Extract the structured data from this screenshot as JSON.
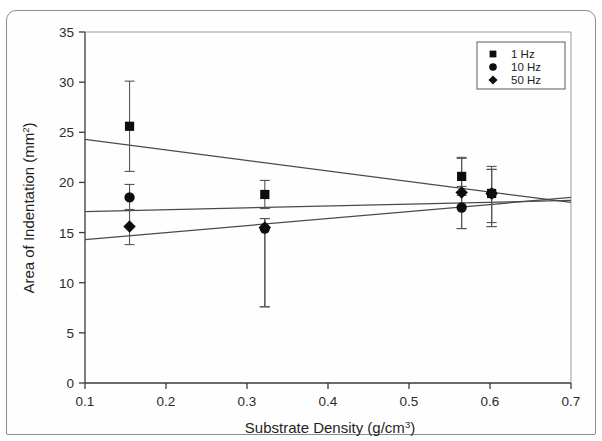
{
  "chart_data": {
    "type": "scatter",
    "title": "",
    "xlabel": "Substrate Density (g/cm3)",
    "xlabel_base": "Substrate Density (g/cm",
    "xlabel_sup": "3",
    "xlabel_tail": ")",
    "ylabel": "Area of Indentation (mm2)",
    "ylabel_base": "Area of Indentation (mm",
    "ylabel_sup": "2",
    "ylabel_tail": ")",
    "xlim": [
      0.1,
      0.7
    ],
    "ylim": [
      0,
      35
    ],
    "xticks": [
      "0.1",
      "0.2",
      "0.3",
      "0.4",
      "0.5",
      "0.6",
      "0.7"
    ],
    "xtick_values": [
      0.1,
      0.2,
      0.3,
      0.4,
      0.5,
      0.6,
      0.7
    ],
    "yticks": [
      "0",
      "5",
      "10",
      "15",
      "20",
      "25",
      "30",
      "35"
    ],
    "ytick_values": [
      0,
      5,
      10,
      15,
      20,
      25,
      30,
      35
    ],
    "grid": false,
    "legend_position": "top-right",
    "legend": [
      {
        "label": "1 Hz",
        "marker": "square"
      },
      {
        "label": "10 Hz",
        "marker": "circle"
      },
      {
        "label": "50 Hz",
        "marker": "diamond"
      }
    ],
    "series": [
      {
        "name": "1 Hz",
        "marker": "square",
        "points": [
          {
            "x": 0.155,
            "y": 25.6,
            "err_low": 21.1,
            "err_high": 30.1
          },
          {
            "x": 0.322,
            "y": 18.8,
            "err_low": 17.4,
            "err_high": 20.2
          },
          {
            "x": 0.565,
            "y": 20.6,
            "err_low": 18.7,
            "err_high": 22.5
          },
          {
            "x": 0.602,
            "y": 18.9,
            "err_low": 16.0,
            "err_high": 21.6
          }
        ],
        "trend": {
          "x0": 0.1,
          "y0": 24.3,
          "x1": 0.7,
          "y1": 18.0
        }
      },
      {
        "name": "10 Hz",
        "marker": "circle",
        "points": [
          {
            "x": 0.155,
            "y": 18.5,
            "err_low": 17.2,
            "err_high": 19.8
          },
          {
            "x": 0.322,
            "y": 15.4,
            "err_low": 7.6,
            "err_high": 16.4
          },
          {
            "x": 0.565,
            "y": 17.5,
            "err_low": 15.4,
            "err_high": 19.6
          },
          {
            "x": 0.602,
            "y": 18.9,
            "err_low": 15.6,
            "err_high": 21.3
          }
        ],
        "trend": {
          "x0": 0.1,
          "y0": 17.1,
          "x1": 0.7,
          "y1": 18.2
        }
      },
      {
        "name": "50 Hz",
        "marker": "diamond",
        "points": [
          {
            "x": 0.155,
            "y": 15.6,
            "err_low": 13.8,
            "err_high": 17.3
          },
          {
            "x": 0.322,
            "y": 15.5,
            "err_low": 7.6,
            "err_high": 16.4
          },
          {
            "x": 0.565,
            "y": 19.0,
            "err_low": 15.4,
            "err_high": 22.4
          },
          {
            "x": 0.602,
            "y": 18.9,
            "err_low": 15.6,
            "err_high": 21.3
          }
        ],
        "trend": {
          "x0": 0.1,
          "y0": 14.3,
          "x1": 0.7,
          "y1": 18.5
        }
      }
    ]
  }
}
